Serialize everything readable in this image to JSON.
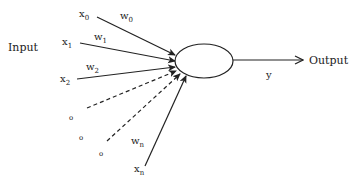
{
  "diagram": {
    "input_label": "Input",
    "output_label": "Output",
    "output_symbol": "y",
    "inputs": [
      {
        "var": "x",
        "sub": "0",
        "weight": "w",
        "weight_sub": "0",
        "style": "solid"
      },
      {
        "var": "x",
        "sub": "1",
        "weight": "w",
        "weight_sub": "1",
        "style": "solid"
      },
      {
        "var": "x",
        "sub": "2",
        "weight": "w",
        "weight_sub": "2",
        "style": "solid"
      },
      {
        "var": "",
        "sub": "",
        "weight": "",
        "weight_sub": "",
        "style": "dashed"
      },
      {
        "var": "",
        "sub": "",
        "weight": "",
        "weight_sub": "",
        "style": "dashed"
      },
      {
        "var": "x",
        "sub": "n",
        "weight": "w",
        "weight_sub": "n",
        "style": "solid"
      }
    ],
    "ellipsis_dots": [
      "o",
      "o",
      "o"
    ],
    "colors": {
      "stroke": "#222222",
      "background": "#ffffff"
    }
  }
}
